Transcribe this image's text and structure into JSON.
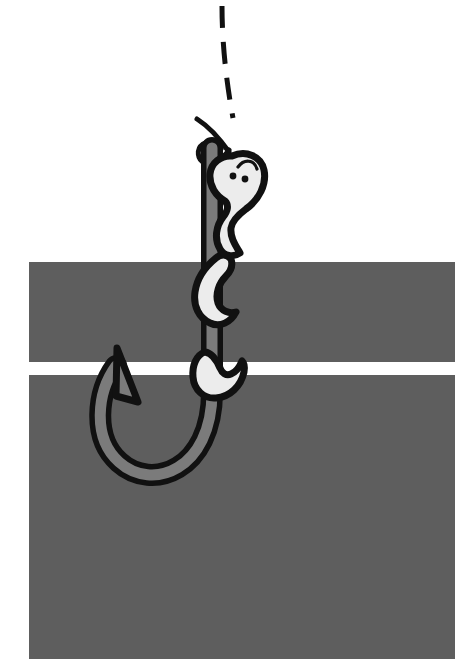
{
  "illustration": {
    "title": "Worm on a fishing hook",
    "alt_text": "A cartoon earthworm with two eyes coiled around the shank of a fishing hook, hanging from a dashed fishing line, in front of two horizontal gray bands.",
    "canvas": {
      "width": 471,
      "height": 659
    },
    "palette": {
      "background": "#ffffff",
      "band_gray": "#5e5e5e",
      "hook_fill": "#7b7b7b",
      "worm_fill": "#ececec",
      "outline": "#111111",
      "eye": "#111111",
      "line": "#111111"
    },
    "bands": [
      {
        "name": "upper-band",
        "x": 29,
        "y": 262,
        "width": 426,
        "height": 100
      },
      {
        "name": "lower-band",
        "x": 29,
        "y": 375,
        "width": 426,
        "height": 284
      }
    ],
    "fishing_line": {
      "name": "dashed-fishing-line",
      "style": "dashed",
      "stroke_width": 5,
      "dash_pattern": "22 14",
      "path": "M 222 6 C 222 40, 226 78, 233 116"
    },
    "line_knot": {
      "name": "line-knot-loop",
      "stroke_width": 5,
      "path": "M 198 120 C 210 130, 222 142, 231 154 M 232 118 C 228 132, 224 144, 221 152 C 214 163, 200 162, 198 152 C 196 142, 206 136, 216 142"
    },
    "hook": {
      "name": "fishing-hook",
      "stroke_width": 7,
      "shank_width": 15,
      "description": "J-shaped hook with barbed point pointing up-left",
      "body_path": "M 220 150 L 220 390 C 220 468, 165 492, 133 468 C 100 444, 104 392, 120 366 L 122 370 C 112 396, 114 438, 140 452 C 168 466, 205 448, 205 390 L 205 150 Z",
      "barb_path": "M 120 366 L 139 399 L 121 398 Z"
    },
    "worm": {
      "name": "cartoon-worm",
      "stroke_width": 7,
      "segments": [
        {
          "name": "worm-head-segment",
          "note": "head with two eyes and brow, upper coil"
        },
        {
          "name": "worm-middle-segment",
          "note": "mid-body coil crossing the shank"
        },
        {
          "name": "worm-tail-segment",
          "note": "lower tail coil with curled tip"
        }
      ],
      "eyes": [
        {
          "name": "worm-eye-left",
          "cx": 233,
          "cy": 176,
          "r": 3.4
        },
        {
          "name": "worm-eye-right",
          "cx": 245,
          "cy": 179,
          "r": 3.4
        }
      ],
      "brow": {
        "name": "worm-brow",
        "path": "M 239 166 C 245 159, 254 160, 256 169"
      }
    }
  }
}
